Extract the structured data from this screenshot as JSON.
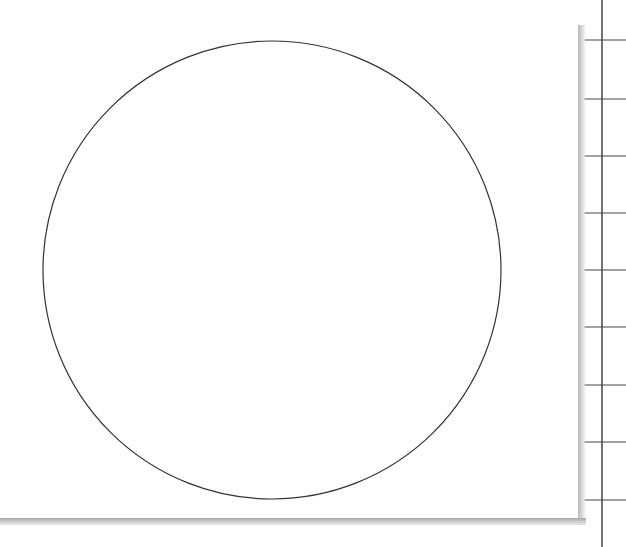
{
  "diagram": {
    "shape": "circle",
    "circle": {
      "cx": 272,
      "cy": 270,
      "r": 229,
      "stroke": "#333333",
      "fill": "#ffffff"
    },
    "grid": {
      "vertical_line_x": 602,
      "horizontal_lines_y": [
        40,
        99,
        156,
        213,
        270,
        327,
        385,
        442,
        500
      ],
      "line_color": "#444444"
    },
    "panel": {
      "background": "#ffffff",
      "shadow_color": "#b0b0b0"
    }
  }
}
